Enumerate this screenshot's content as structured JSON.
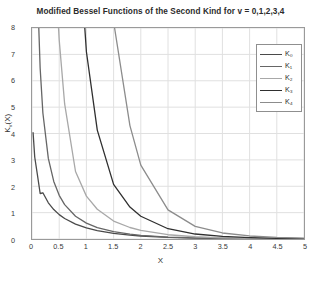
{
  "chart_data": {
    "type": "line",
    "title": "Modified Bessel Functions of the Second Kind for v = 0,1,2,3,4",
    "xlabel": "X",
    "ylabel": "K_v(X)",
    "xlim": [
      0,
      5
    ],
    "ylim": [
      0,
      8
    ],
    "grid": true,
    "legend_position": "top-right",
    "xticks": [
      0,
      0.5,
      1,
      1.5,
      2,
      2.5,
      3,
      3.5,
      4,
      4.5,
      5
    ],
    "xtick_labels": [
      "0",
      "0.5",
      "1",
      "1.5",
      "2",
      "2.5",
      "3",
      "3.5",
      "4",
      "4.5",
      "5"
    ],
    "yticks": [
      0,
      1,
      2,
      3,
      4,
      5,
      6,
      7,
      8
    ],
    "ytick_labels": [
      "0",
      "1",
      "2",
      "3",
      "4",
      "5",
      "6",
      "7",
      "8"
    ],
    "x": [
      0.02,
      0.05,
      0.1,
      0.15,
      0.2,
      0.3,
      0.4,
      0.5,
      0.6,
      0.8,
      1.0,
      1.2,
      1.5,
      1.8,
      2.0,
      2.5,
      3.0,
      3.5,
      4.0,
      4.5,
      5.0
    ],
    "series": [
      {
        "name": "K_0",
        "label": "K₀",
        "color": "#4a4a4a",
        "values": [
          4.03,
          3.11,
          2.427,
          1.725,
          1.753,
          1.372,
          1.115,
          0.924,
          0.778,
          0.565,
          0.421,
          0.318,
          0.214,
          0.146,
          0.114,
          0.062,
          0.035,
          0.02,
          0.011,
          0.006,
          0.004
        ]
      },
      {
        "name": "K_1",
        "label": "K₁",
        "color": "#666666",
        "values": [
          49.85,
          19.91,
          9.854,
          6.477,
          4.776,
          3.056,
          2.184,
          1.656,
          1.303,
          0.862,
          0.602,
          0.434,
          0.277,
          0.183,
          0.14,
          0.0739,
          0.0402,
          0.0222,
          0.0125,
          0.0071,
          0.004
        ]
      },
      {
        "name": "K_2",
        "label": "K₂",
        "color": "#a8a8a8",
        "values": [
          4999.5,
          799.5,
          199.5,
          88.4,
          49.5,
          21.7,
          12.0,
          7.55,
          5.12,
          2.56,
          1.625,
          1.127,
          0.68,
          0.436,
          0.325,
          0.162,
          0.0846,
          0.0456,
          0.0251,
          0.0141,
          0.008
        ]
      },
      {
        "name": "K_3",
        "label": "K₃",
        "color": "#2f2f2f",
        "values": [
          999999,
          63998,
          7999,
          2369,
          999,
          296,
          125.5,
          64.1,
          37.2,
          16.0,
          7.1,
          4.13,
          2.07,
          1.21,
          0.862,
          0.39,
          0.189,
          0.0966,
          0.0512,
          0.0279,
          0.0155
        ]
      },
      {
        "name": "K_4",
        "label": "K₄",
        "color": "#8c8c8c",
        "values": [
          5999990,
          383993,
          47994,
          9477,
          2999,
          1184,
          502,
          245,
          134,
          49.0,
          44.2,
          21.3,
          8.32,
          4.3,
          2.8,
          1.105,
          0.48,
          0.228,
          0.1145,
          0.0599,
          0.0324
        ]
      }
    ]
  },
  "legend": {
    "entries": [
      {
        "label": "K₀"
      },
      {
        "label": "K₁"
      },
      {
        "label": "K₂"
      },
      {
        "label": "K₃"
      },
      {
        "label": "K₄"
      }
    ]
  },
  "colors": {
    "axis": "#9a9a9a",
    "grid": "#e0e0e0",
    "text": "#333333"
  }
}
